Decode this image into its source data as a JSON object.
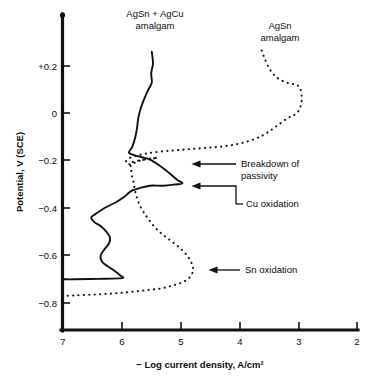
{
  "chart_data": {
    "type": "line",
    "title": "",
    "xlabel": "− Log current density, A/cm²",
    "ylabel": "Potential, V (SCE)",
    "xlim": [
      7,
      2
    ],
    "ylim": [
      -0.9,
      0.3
    ],
    "x_reversed": true,
    "grid": false,
    "legend_position": "inline-labels",
    "xticks": [
      "7",
      "6",
      "5",
      "4",
      "3",
      "2"
    ],
    "xtick_values": [
      7,
      6,
      5,
      4,
      3,
      2
    ],
    "yticks": [
      "+0.2",
      "0",
      "−0.2",
      "−0.4",
      "−0.6",
      "−0.8"
    ],
    "ytick_values": [
      0.2,
      0,
      -0.2,
      -0.4,
      -0.6,
      -0.8
    ],
    "series": [
      {
        "name": "AgSn + AgCu amalgam",
        "style": "solid",
        "color": "#111111",
        "points": [
          [
            5.49,
            0.26
          ],
          [
            5.47,
            0.21
          ],
          [
            5.5,
            0.17
          ],
          [
            5.49,
            0.13
          ],
          [
            5.55,
            0.1
          ],
          [
            5.62,
            0.06
          ],
          [
            5.68,
            0.02
          ],
          [
            5.72,
            -0.02
          ],
          [
            5.74,
            -0.06
          ],
          [
            5.77,
            -0.1
          ],
          [
            5.82,
            -0.14
          ],
          [
            5.88,
            -0.165
          ],
          [
            5.8,
            -0.175
          ],
          [
            5.66,
            -0.185
          ],
          [
            5.52,
            -0.195
          ],
          [
            5.36,
            -0.22
          ],
          [
            5.2,
            -0.25
          ],
          [
            5.06,
            -0.28
          ],
          [
            4.97,
            -0.295
          ],
          [
            5.1,
            -0.3
          ],
          [
            5.3,
            -0.305
          ],
          [
            5.52,
            -0.305
          ],
          [
            5.7,
            -0.315
          ],
          [
            5.82,
            -0.325
          ],
          [
            5.88,
            -0.335
          ],
          [
            5.95,
            -0.35
          ],
          [
            6.1,
            -0.375
          ],
          [
            6.3,
            -0.4
          ],
          [
            6.45,
            -0.425
          ],
          [
            6.52,
            -0.44
          ],
          [
            6.46,
            -0.46
          ],
          [
            6.36,
            -0.475
          ],
          [
            6.26,
            -0.5
          ],
          [
            6.2,
            -0.525
          ],
          [
            6.22,
            -0.55
          ],
          [
            6.3,
            -0.575
          ],
          [
            6.36,
            -0.6
          ],
          [
            6.34,
            -0.625
          ],
          [
            6.24,
            -0.645
          ],
          [
            6.12,
            -0.665
          ],
          [
            6.02,
            -0.685
          ],
          [
            6.0,
            -0.695
          ],
          [
            6.4,
            -0.698
          ],
          [
            6.8,
            -0.7
          ],
          [
            7.0,
            -0.7
          ]
        ]
      },
      {
        "name": "AgSn amalgam",
        "style": "dotted",
        "color": "#1a1a1a",
        "points": [
          [
            3.62,
            0.265
          ],
          [
            3.56,
            0.225
          ],
          [
            3.48,
            0.185
          ],
          [
            3.38,
            0.155
          ],
          [
            3.25,
            0.135
          ],
          [
            3.12,
            0.125
          ],
          [
            3.02,
            0.12
          ],
          [
            2.96,
            0.1
          ],
          [
            2.94,
            0.07
          ],
          [
            2.95,
            0.04
          ],
          [
            2.99,
            0.012
          ],
          [
            3.06,
            -0.005
          ],
          [
            3.18,
            -0.02
          ],
          [
            3.32,
            -0.045
          ],
          [
            3.46,
            -0.07
          ],
          [
            3.62,
            -0.095
          ],
          [
            3.82,
            -0.115
          ],
          [
            4.05,
            -0.13
          ],
          [
            4.3,
            -0.14
          ],
          [
            4.55,
            -0.145
          ],
          [
            4.8,
            -0.15
          ],
          [
            5.05,
            -0.155
          ],
          [
            5.3,
            -0.16
          ],
          [
            5.55,
            -0.168
          ],
          [
            5.75,
            -0.178
          ],
          [
            5.88,
            -0.19
          ],
          [
            5.93,
            -0.205
          ],
          [
            5.86,
            -0.215
          ],
          [
            5.7,
            -0.2
          ],
          [
            5.56,
            -0.192
          ],
          [
            5.4,
            -0.188
          ],
          [
            5.82,
            -0.205
          ],
          [
            5.84,
            -0.23
          ],
          [
            5.83,
            -0.26
          ],
          [
            5.8,
            -0.29
          ],
          [
            5.78,
            -0.32
          ],
          [
            5.75,
            -0.35
          ],
          [
            5.7,
            -0.385
          ],
          [
            5.62,
            -0.42
          ],
          [
            5.52,
            -0.455
          ],
          [
            5.4,
            -0.49
          ],
          [
            5.26,
            -0.52
          ],
          [
            5.1,
            -0.55
          ],
          [
            4.96,
            -0.58
          ],
          [
            4.86,
            -0.61
          ],
          [
            4.8,
            -0.64
          ],
          [
            4.79,
            -0.665
          ],
          [
            4.84,
            -0.69
          ],
          [
            4.95,
            -0.71
          ],
          [
            5.12,
            -0.725
          ],
          [
            5.32,
            -0.738
          ],
          [
            5.55,
            -0.745
          ],
          [
            5.8,
            -0.752
          ],
          [
            6.05,
            -0.758
          ],
          [
            6.3,
            -0.762
          ],
          [
            6.55,
            -0.765
          ],
          [
            6.8,
            -0.768
          ],
          [
            7.0,
            -0.77
          ]
        ]
      }
    ],
    "annotations": [
      {
        "id": "breakdown-of-passivity",
        "text_line1": "Breakdown of",
        "text_line2": "passivity"
      },
      {
        "id": "cu-oxidation",
        "text_line1": "Cu oxidation",
        "text_line2": ""
      },
      {
        "id": "sn-oxidation",
        "text_line1": "Sn oxidation",
        "text_line2": ""
      }
    ],
    "series_labels": [
      {
        "id": "agsn-agcu-amalgam",
        "line1": "AgSn + AgCu",
        "line2": "amalgam"
      },
      {
        "id": "agsn-amalgam",
        "line1": "AgSn",
        "line2": "amalgam"
      }
    ]
  },
  "axes": {
    "y_title": "Potential, V (SCE)",
    "x_title": "− Log current density, A/cm²",
    "y_tick_labels": [
      "+0.2",
      "0",
      "−0.2",
      "−0.4",
      "−0.6",
      "−0.8"
    ],
    "x_tick_labels": [
      "7",
      "6",
      "5",
      "4",
      "3",
      "2"
    ]
  },
  "colors": {
    "ink": "#111111",
    "background": "#ffffff"
  }
}
